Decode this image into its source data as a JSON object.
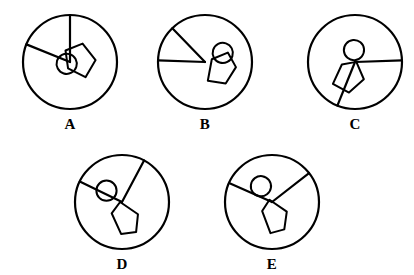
{
  "page": {
    "background_color": "#ffffff",
    "ink_color": "#000000",
    "width": 414,
    "height": 275,
    "kind": "spatial-rotation-multiple-choice-figures"
  },
  "figures": [
    {
      "id": "A",
      "label": "A",
      "cx": 70,
      "cy": 62,
      "r": 47,
      "label_x": 70,
      "label_y": 112,
      "rotation": -118,
      "inner": {
        "small_circle": {
          "cx": 0.0,
          "cy": -0.08,
          "r": 0.215
        },
        "pentagon": [
          [
            -0.1,
            -0.1
          ],
          [
            0.26,
            0.03
          ],
          [
            0.22,
            0.42
          ],
          [
            -0.22,
            0.5
          ],
          [
            -0.44,
            0.14
          ]
        ],
        "spoke_long_angle": -40,
        "spoke_long_len": 1.0,
        "spoke_short_angle": 28,
        "spoke_short_len": 1.0
      }
    },
    {
      "id": "B",
      "label": "B",
      "cx": 205,
      "cy": 62,
      "r": 47,
      "label_x": 205,
      "label_y": 112,
      "rotation": -72,
      "inner": {
        "small_circle": {
          "cx": 0.3,
          "cy": 0.3,
          "r": 0.215
        },
        "pentagon": [
          [
            0.1,
            0.12
          ],
          [
            0.34,
            0.4
          ],
          [
            0.1,
            0.66
          ],
          [
            -0.3,
            0.56
          ],
          [
            -0.36,
            0.18
          ]
        ],
        "spoke_long_angle": -62,
        "spoke_long_len": 1.0,
        "spoke_short_angle": -106,
        "spoke_short_len": 1.0
      }
    },
    {
      "id": "C",
      "label": "C",
      "cx": 355,
      "cy": 62,
      "r": 47,
      "label_x": 355,
      "label_y": 112,
      "rotation": 40,
      "inner": {
        "small_circle": {
          "cx": -0.18,
          "cy": -0.18,
          "r": 0.215
        },
        "pentagon": [
          [
            0.02,
            -0.02
          ],
          [
            0.38,
            0.16
          ],
          [
            0.32,
            0.58
          ],
          [
            -0.06,
            0.66
          ],
          [
            -0.18,
            0.22
          ]
        ],
        "spoke_long_angle": -42,
        "spoke_long_len": 1.0,
        "spoke_short_angle": 72,
        "spoke_short_len": 1.0
      }
    },
    {
      "id": "D",
      "label": "D",
      "cx": 122,
      "cy": 202,
      "r": 47,
      "label_x": 122,
      "label_y": 252,
      "rotation": 0,
      "inner": {
        "small_circle": {
          "cx": -0.33,
          "cy": -0.24,
          "r": 0.215
        },
        "pentagon": [
          [
            -0.04,
            0.0
          ],
          [
            0.34,
            0.26
          ],
          [
            0.3,
            0.64
          ],
          [
            -0.02,
            0.68
          ],
          [
            -0.22,
            0.24
          ]
        ],
        "spoke_long_angle": -62,
        "spoke_long_len": 1.0,
        "spoke_short_angle": 206,
        "spoke_short_len": 1.0
      }
    },
    {
      "id": "E",
      "label": "E",
      "cx": 272,
      "cy": 202,
      "r": 47,
      "label_x": 272,
      "label_y": 252,
      "rotation": 8,
      "inner": {
        "small_circle": {
          "cx": -0.28,
          "cy": -0.3,
          "r": 0.215
        },
        "pentagon": [
          [
            -0.06,
            -0.04
          ],
          [
            0.34,
            0.16
          ],
          [
            0.34,
            0.54
          ],
          [
            0.06,
            0.66
          ],
          [
            -0.18,
            0.22
          ]
        ],
        "spoke_long_angle": -46,
        "spoke_long_len": 1.0,
        "spoke_short_angle": 196,
        "spoke_short_len": 1.0
      }
    }
  ]
}
